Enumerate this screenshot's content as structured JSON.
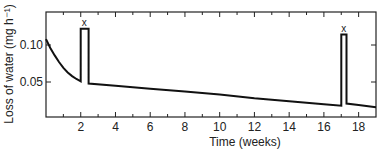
{
  "chart_data": {
    "type": "line",
    "title": "",
    "xlabel": "Time (weeks)",
    "ylabel": "Loss of water (mg h⁻¹)",
    "xlim": [
      0,
      19
    ],
    "ylim": [
      0,
      0.145
    ],
    "xticks": [
      2,
      4,
      6,
      8,
      10,
      12,
      14,
      16,
      18
    ],
    "xtick_labels": [
      "2",
      "4",
      "6",
      "8",
      "10",
      "12",
      "14",
      "16",
      "18"
    ],
    "xminor_ticks": [
      1,
      3,
      5,
      7,
      9,
      11,
      13,
      15,
      17
    ],
    "yticks": [
      0.05,
      0.1
    ],
    "ytick_labels": [
      "0.05",
      "0.10"
    ],
    "grid": false,
    "legend": null,
    "series": [
      {
        "name": "Loss of water",
        "points": [
          [
            0,
            0.108
          ],
          [
            0.25,
            0.096
          ],
          [
            0.5,
            0.086
          ],
          [
            0.75,
            0.077
          ],
          [
            1.0,
            0.069
          ],
          [
            1.25,
            0.063
          ],
          [
            1.5,
            0.058
          ],
          [
            1.75,
            0.054
          ],
          [
            2.0,
            0.051
          ],
          [
            2.0,
            0.122
          ],
          [
            2.45,
            0.122
          ],
          [
            2.45,
            0.048
          ],
          [
            4,
            0.045
          ],
          [
            6,
            0.041
          ],
          [
            8,
            0.037
          ],
          [
            10,
            0.033
          ],
          [
            12,
            0.028
          ],
          [
            14,
            0.024
          ],
          [
            16,
            0.02
          ],
          [
            17.0,
            0.018
          ],
          [
            17.0,
            0.114
          ],
          [
            17.3,
            0.114
          ],
          [
            17.3,
            0.021
          ],
          [
            18,
            0.019
          ],
          [
            19,
            0.016
          ]
        ]
      }
    ],
    "annotations": [
      {
        "text": "x",
        "x": 2.2,
        "y": 0.122
      },
      {
        "text": "x",
        "x": 17.15,
        "y": 0.114
      }
    ]
  }
}
